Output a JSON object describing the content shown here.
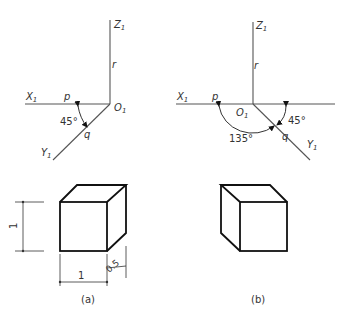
{
  "figure_a": {
    "caption": "(a)",
    "axes": {
      "z_label": "Z",
      "z_sub": "1",
      "x_label": "X",
      "x_sub": "1",
      "y_label": "Y",
      "y_sub": "1",
      "origin_label": "O",
      "origin_sub": "1",
      "p_label": "p",
      "q_label": "q",
      "r_label": "r",
      "angle_label": "45°"
    },
    "cube": {
      "height_dim": "1",
      "width_dim": "1",
      "depth_dim": "0.5"
    }
  },
  "figure_b": {
    "caption": "(b)",
    "axes": {
      "z_label": "Z",
      "z_sub": "1",
      "x_label": "X",
      "x_sub": "1",
      "y_label": "Y",
      "y_sub": "1",
      "origin_label": "O",
      "origin_sub": "1",
      "p_label": "p",
      "q_label": "q",
      "r_label": "r",
      "angle_large_label": "135°",
      "angle_small_label": "45°"
    }
  }
}
